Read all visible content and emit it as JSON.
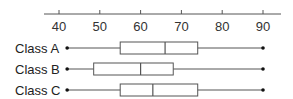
{
  "chart_data": {
    "type": "boxplot",
    "orientation": "horizontal",
    "title": "",
    "xlabel": "",
    "ylabel": "",
    "xlim": [
      36,
      94
    ],
    "axis_position": "top",
    "grid": false,
    "ticks": [
      40,
      50,
      60,
      70,
      80,
      90
    ],
    "tick_labels": [
      "40",
      "50",
      "60",
      "70",
      "80",
      "90"
    ],
    "categories": [
      "Class A",
      "Class B",
      "Class C"
    ],
    "series": [
      {
        "name": "Class A",
        "min": 42,
        "q1": 55,
        "median": 66,
        "q3": 74,
        "max": 90
      },
      {
        "name": "Class B",
        "min": 42,
        "q1": 48.5,
        "median": 60,
        "q3": 68,
        "max": 90
      },
      {
        "name": "Class C",
        "min": 42,
        "q1": 55,
        "median": 63,
        "q3": 74,
        "max": 90
      }
    ],
    "colors": {
      "line": "#555555",
      "box_fill": "#ffffff",
      "dot": "#111111"
    }
  }
}
